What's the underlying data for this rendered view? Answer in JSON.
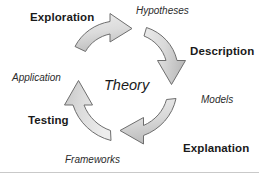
{
  "diagram": {
    "title_center": "Theory",
    "phases": [
      {
        "id": "exploration",
        "label": "Exploration"
      },
      {
        "id": "description",
        "label": "Description"
      },
      {
        "id": "explanation",
        "label": "Explanation"
      },
      {
        "id": "testing",
        "label": "Testing"
      }
    ],
    "products": [
      {
        "id": "hypotheses",
        "label": "Hypotheses"
      },
      {
        "id": "models",
        "label": "Models"
      },
      {
        "id": "frameworks",
        "label": "Frameworks"
      },
      {
        "id": "application",
        "label": "Application"
      }
    ],
    "arrows": [
      {
        "id": "arrow-top",
        "direction": "right",
        "from": "Exploration",
        "to": "Hypotheses"
      },
      {
        "id": "arrow-right",
        "direction": "down",
        "from": "Description",
        "to": "Models"
      },
      {
        "id": "arrow-bottom",
        "direction": "left",
        "from": "Explanation",
        "to": "Frameworks"
      },
      {
        "id": "arrow-left",
        "direction": "up",
        "from": "Testing",
        "to": "Application"
      }
    ],
    "colors": {
      "arrow_fill_light": "#e2e2e2",
      "arrow_fill_dark": "#bdbdbd",
      "arrow_stroke": "#6e6e6e",
      "text": "#1a1a1a",
      "background": "#ffffff",
      "rule": "#c9c9c9"
    }
  }
}
